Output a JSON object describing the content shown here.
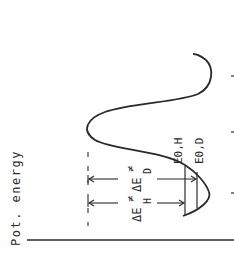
{
  "diagram": {
    "type": "potential-energy-curve",
    "orientation": "rotated-90-ccw",
    "axis_label": "Pot. energy",
    "labels": {
      "delta_e_h": {
        "main": "ΔE",
        "sup": "≠",
        "sub": "H"
      },
      "delta_e_d": {
        "main": "ΔE",
        "sup": "≠",
        "sub": "D"
      },
      "e0_h": "E0,H",
      "e0_d": "E0,D"
    },
    "colors": {
      "line": "#2a2a2a",
      "background": "#ffffff"
    }
  }
}
